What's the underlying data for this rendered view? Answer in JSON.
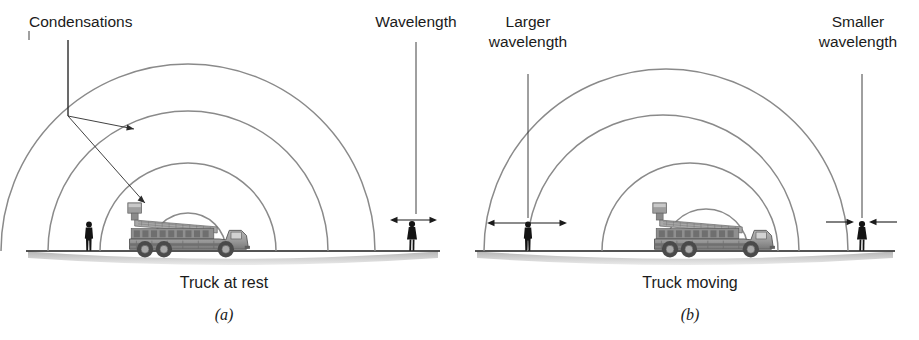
{
  "figure": {
    "background_color": "#ffffff",
    "wave_color": "#8a8a8a",
    "line_color": "#1b1b1b",
    "ground_shadow_color": "#b9b9b9"
  },
  "panels": [
    {
      "id": "a",
      "letter": "(a)",
      "caption": "Truck at rest",
      "labels": {
        "left": "Condensations",
        "right": "Wavelength"
      },
      "source": {
        "x": 188,
        "y": 250,
        "state": "at rest"
      },
      "wave_radii": [
        38,
        88,
        140,
        192
      ],
      "wave_count": 4,
      "observer": {
        "x": 412,
        "y": 250,
        "type": "person"
      },
      "bystander": {
        "x": 89,
        "y": 250,
        "type": "person"
      },
      "dimension": {
        "name": "wavelength",
        "x_start": 392,
        "x_end": 435,
        "y": 220,
        "style": "outward-arrows",
        "relative_size": "normal"
      }
    },
    {
      "id": "b",
      "letter": "(b)",
      "caption": "Truck moving",
      "labels": {
        "left": "Larger\nwavelength",
        "left_line1": "Larger",
        "left_line2": "wavelength",
        "right": "Smaller\nwavelength",
        "right_line1": "Smaller",
        "right_line2": "wavelength"
      },
      "source": {
        "x": 713,
        "y": 250,
        "state": "moving",
        "direction": "right"
      },
      "wave_count": 4,
      "wave_fronts": [
        {
          "center_x": 628,
          "radius": 182
        },
        {
          "center_x": 663,
          "radius": 136
        },
        {
          "center_x": 690,
          "radius": 88
        },
        {
          "center_x": 706,
          "radius": 42
        }
      ],
      "observer_right": {
        "x": 862,
        "y": 250,
        "type": "person"
      },
      "observer_left": {
        "x": 528,
        "y": 250,
        "type": "person"
      },
      "dimension_left": {
        "name": "larger-wavelength",
        "x_start": 489,
        "x_end": 565,
        "y": 223,
        "style": "outward-arrows",
        "relative_size": "larger"
      },
      "dimension_right": {
        "name": "smaller-wavelength",
        "x_start": 852,
        "x_end": 871,
        "y": 222,
        "style": "inward-arrows",
        "relative_size": "smaller"
      }
    }
  ],
  "annotations": {
    "condensations_leader": {
      "label_anchor_x": 29,
      "label_anchor_y": 30,
      "junction_x": 68,
      "junction_y": 116,
      "branch_1_end_x": 134,
      "branch_1_end_y": 129,
      "branch_2_end_x": 145,
      "branch_2_end_y": 203
    },
    "wavelength_leader": {
      "x": 416,
      "y_top": 42,
      "y_bottom": 214
    },
    "larger_wavelength_leader": {
      "x": 528,
      "y_top": 74,
      "y_bottom": 218
    },
    "smaller_wavelength_leader": {
      "x": 862,
      "y_top": 74,
      "y_bottom": 218
    }
  }
}
